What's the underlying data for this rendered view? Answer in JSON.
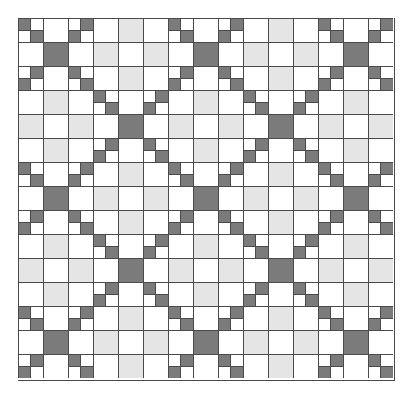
{
  "grid": {
    "columns": 15,
    "rows": 15,
    "legend": {
      "D": "dark gray solid square",
      "L": "light gray solid square",
      "W": "white solid square",
      "N": "four-patch, dark top-left and bottom-right",
      "S": "four-patch, dark top-right and bottom-left"
    },
    "colors": {
      "dark": "#7b7b7b",
      "light": "#e5e5e5",
      "white": "#ffffff",
      "line": "#4a4a4a"
    },
    "cells": [
      [
        "N",
        "W",
        "S",
        "W",
        "L",
        "W",
        "N",
        "W",
        "S",
        "W",
        "L",
        "W",
        "N",
        "W",
        "S"
      ],
      [
        "W",
        "D",
        "W",
        "L",
        "W",
        "L",
        "W",
        "D",
        "W",
        "L",
        "W",
        "L",
        "W",
        "D",
        "W"
      ],
      [
        "S",
        "W",
        "N",
        "W",
        "L",
        "W",
        "S",
        "W",
        "N",
        "W",
        "L",
        "W",
        "S",
        "W",
        "N"
      ],
      [
        "W",
        "L",
        "W",
        "N",
        "W",
        "S",
        "W",
        "L",
        "W",
        "N",
        "W",
        "S",
        "W",
        "L",
        "W"
      ],
      [
        "L",
        "W",
        "L",
        "W",
        "D",
        "W",
        "L",
        "W",
        "L",
        "W",
        "D",
        "W",
        "L",
        "W",
        "L"
      ],
      [
        "W",
        "L",
        "W",
        "S",
        "W",
        "N",
        "W",
        "L",
        "W",
        "S",
        "W",
        "N",
        "W",
        "L",
        "W"
      ],
      [
        "N",
        "W",
        "S",
        "W",
        "L",
        "W",
        "N",
        "W",
        "S",
        "W",
        "L",
        "W",
        "N",
        "W",
        "S"
      ],
      [
        "W",
        "D",
        "W",
        "L",
        "W",
        "L",
        "W",
        "D",
        "W",
        "L",
        "W",
        "L",
        "W",
        "D",
        "W"
      ],
      [
        "S",
        "W",
        "N",
        "W",
        "L",
        "W",
        "S",
        "W",
        "N",
        "W",
        "L",
        "W",
        "S",
        "W",
        "N"
      ],
      [
        "W",
        "L",
        "W",
        "N",
        "W",
        "S",
        "W",
        "L",
        "W",
        "N",
        "W",
        "S",
        "W",
        "L",
        "W"
      ],
      [
        "L",
        "W",
        "L",
        "W",
        "D",
        "W",
        "L",
        "W",
        "L",
        "W",
        "D",
        "W",
        "L",
        "W",
        "L"
      ],
      [
        "W",
        "L",
        "W",
        "S",
        "W",
        "N",
        "W",
        "L",
        "W",
        "S",
        "W",
        "N",
        "W",
        "L",
        "W"
      ],
      [
        "N",
        "W",
        "S",
        "W",
        "L",
        "W",
        "N",
        "W",
        "S",
        "W",
        "L",
        "W",
        "N",
        "W",
        "S"
      ],
      [
        "W",
        "D",
        "W",
        "L",
        "W",
        "L",
        "W",
        "D",
        "W",
        "L",
        "W",
        "L",
        "W",
        "D",
        "W"
      ],
      [
        "S",
        "W",
        "N",
        "W",
        "L",
        "W",
        "S",
        "W",
        "N",
        "W",
        "L",
        "W",
        "S",
        "W",
        "N"
      ]
    ]
  }
}
